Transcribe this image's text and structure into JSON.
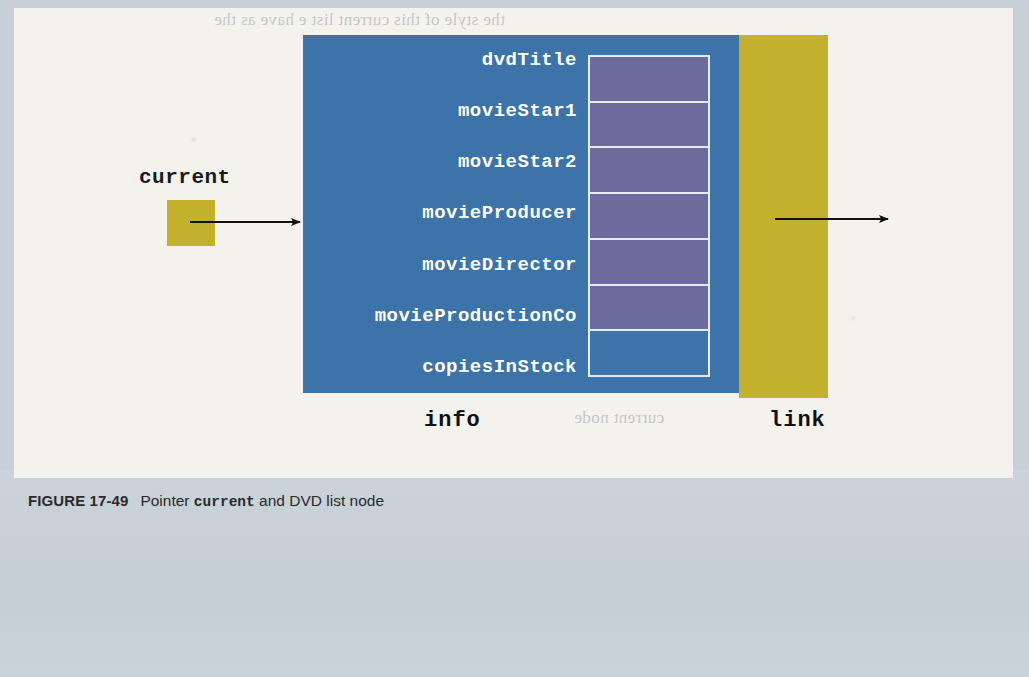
{
  "figure": {
    "caption_label": "FIGURE 17-49",
    "caption_text_before": "Pointer",
    "caption_code": "current",
    "caption_text_after": "and DVD list node"
  },
  "diagram": {
    "pointer": {
      "name": "current",
      "box_color": "#c3b02c"
    },
    "node": {
      "info_label": "info",
      "link_label": "link",
      "info_color": "#3c73a8",
      "link_color": "#c3b02c",
      "cell_fill_color": "#6b6b9e",
      "cell_border_color": "#e8ecf2",
      "fields": [
        {
          "label": "dvdTitle",
          "filled": true
        },
        {
          "label": "movieStar1",
          "filled": true
        },
        {
          "label": "movieStar2",
          "filled": true
        },
        {
          "label": "movieProducer",
          "filled": true
        },
        {
          "label": "movieDirector",
          "filled": true
        },
        {
          "label": "movieProductionCo",
          "filled": true
        },
        {
          "label": "copiesInStock",
          "filled": false
        }
      ]
    },
    "arrows": [
      {
        "name": "current-to-node",
        "from_x": 190,
        "to_x": 303,
        "y": 222
      },
      {
        "name": "link-to-next",
        "from_x": 775,
        "to_x": 890,
        "y": 219
      }
    ]
  },
  "page": {
    "background_color": "#c6d0d6",
    "panel_color": "#f4f2ec",
    "ghost_lines": [
      "the style of this current list  e have as the",
      "following section",
      "current  node"
    ]
  }
}
